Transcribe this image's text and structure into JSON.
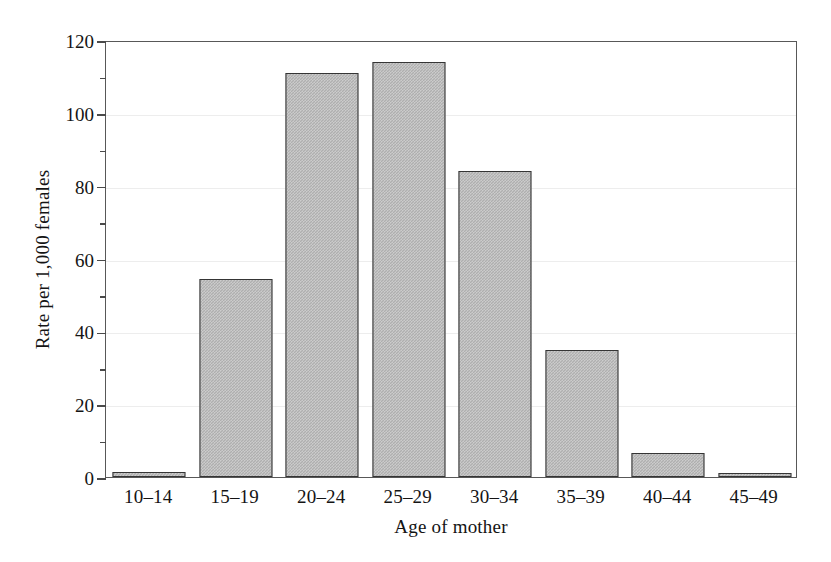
{
  "chart_data": {
    "type": "bar",
    "title": "",
    "xlabel": "Age of mother",
    "ylabel": "Rate per 1,000 females",
    "categories": [
      "10–14",
      "15–19",
      "20–24",
      "25–29",
      "30–34",
      "35–39",
      "40–44",
      "45–49"
    ],
    "values": [
      1.5,
      54.5,
      111,
      114,
      84,
      35,
      6.5,
      0.5
    ],
    "ylim": [
      0,
      120
    ],
    "xlim_type": "categorical",
    "y_major_ticks": [
      0,
      20,
      40,
      60,
      80,
      100,
      120
    ],
    "y_minor_ticks": [
      10,
      30,
      50,
      70,
      90,
      110
    ],
    "y_tick_labels": [
      "0",
      "20",
      "40",
      "60",
      "80",
      "100",
      "120"
    ],
    "grid": true,
    "grid_axis": "y",
    "legend": false,
    "legend_position": "none",
    "bar_fill_color": "#aeaeae",
    "bar_edge_color": "#353535",
    "frame_color": "#585858",
    "grid_color": "#ededed",
    "background_color": "#ffffff",
    "text_color": "#141414"
  }
}
